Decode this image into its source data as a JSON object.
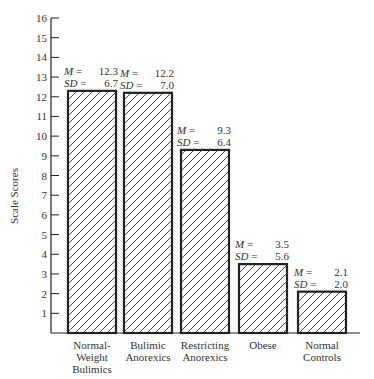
{
  "chart_data": {
    "type": "bar",
    "title": "",
    "xlabel": "",
    "ylabel": "Scale Scores",
    "ylim": [
      0,
      16
    ],
    "yticks": [
      1,
      2,
      3,
      4,
      5,
      6,
      7,
      8,
      9,
      10,
      11,
      12,
      13,
      14,
      15,
      16
    ],
    "grid": false,
    "pattern": "diagonal-hatch",
    "categories": [
      [
        "Normal-",
        "Weight",
        "Bulimics"
      ],
      [
        "Bulimic",
        "Anorexics"
      ],
      [
        "Restricting",
        "Anorexics"
      ],
      [
        "Obese"
      ],
      [
        "Normal",
        "Controls"
      ]
    ],
    "values": [
      12.3,
      12.2,
      9.3,
      3.5,
      2.1
    ],
    "sd": [
      6.7,
      7.0,
      6.4,
      5.6,
      2.0
    ],
    "annotations": [
      {
        "m_label": "M",
        "m_value": "12.3",
        "sd_label": "SD",
        "sd_value": "6.7"
      },
      {
        "m_label": "M",
        "m_value": "12.2",
        "sd_label": "SD",
        "sd_value": "7.0"
      },
      {
        "m_label": "M",
        "m_value": "9.3",
        "sd_label": "SD",
        "sd_value": "6.4"
      },
      {
        "m_label": "M",
        "m_value": "3.5",
        "sd_label": "SD",
        "sd_value": "5.6"
      },
      {
        "m_label": "M",
        "m_value": "2.1",
        "sd_label": "SD",
        "sd_value": "2.0"
      }
    ]
  },
  "colors": {
    "ink": "#222222",
    "background": "#ffffff"
  }
}
